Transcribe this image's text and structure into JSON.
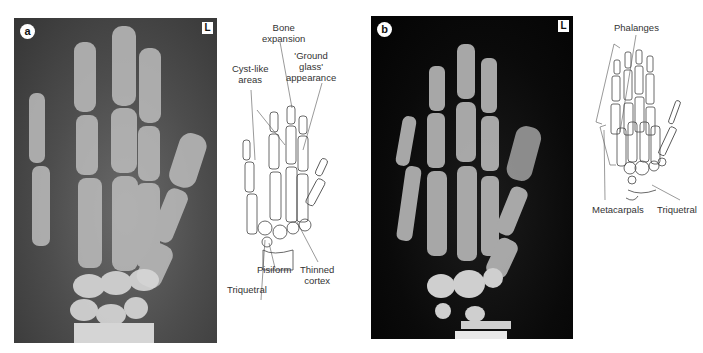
{
  "panel_a": {
    "letter": "a",
    "side_marker": "L",
    "labels": {
      "bone_expansion_1": "Bone",
      "bone_expansion_2": "expansion",
      "ground_glass_1": "'Ground",
      "ground_glass_2": "glass'",
      "ground_glass_3": "appearance",
      "cyst_like_1": "Cyst-like",
      "cyst_like_2": "areas",
      "pisiform": "Pisiform",
      "thinned_cortex_1": "Thinned",
      "thinned_cortex_2": "cortex",
      "triquetral": "Triquetral"
    }
  },
  "panel_b": {
    "letter": "b",
    "side_marker": "L",
    "labels": {
      "phalanges": "Phalanges",
      "metacarpals": "Metacarpals",
      "triquetral": "Triquetral"
    }
  }
}
